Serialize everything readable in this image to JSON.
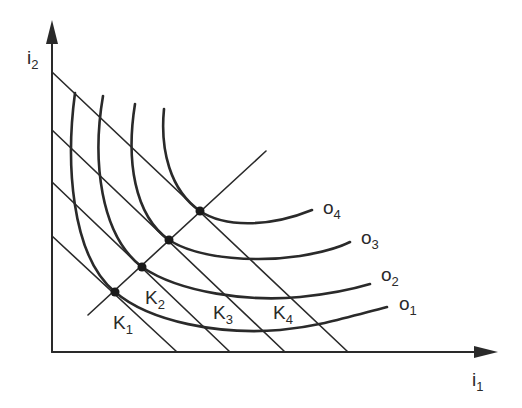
{
  "axes": {
    "y_label": "i",
    "y_sub": "2",
    "x_label": "i",
    "x_sub": "1"
  },
  "isocost_lines": [
    {
      "label": "K",
      "sub": "1",
      "y_intercept_px": 236,
      "x_intercept_px": 177
    },
    {
      "label": "K",
      "sub": "2",
      "y_intercept_px": 182,
      "x_intercept_px": 230
    },
    {
      "label": "K",
      "sub": "3",
      "y_intercept_px": 130,
      "x_intercept_px": 285
    },
    {
      "label": "K",
      "sub": "4",
      "y_intercept_px": 72,
      "x_intercept_px": 348
    }
  ],
  "isoquants": [
    {
      "label": "o",
      "sub": "1"
    },
    {
      "label": "o",
      "sub": "2"
    },
    {
      "label": "o",
      "sub": "3"
    },
    {
      "label": "o",
      "sub": "4"
    }
  ],
  "tangency_points": [
    {
      "name": "K1-o1",
      "x": 115,
      "y": 292
    },
    {
      "name": "K2-o2",
      "x": 142,
      "y": 267
    },
    {
      "name": "K3-o3",
      "x": 169,
      "y": 240
    },
    {
      "name": "K4-o4",
      "x": 200,
      "y": 211
    }
  ],
  "colors": {
    "ink": "#2a2a2a",
    "background": "#ffffff"
  }
}
